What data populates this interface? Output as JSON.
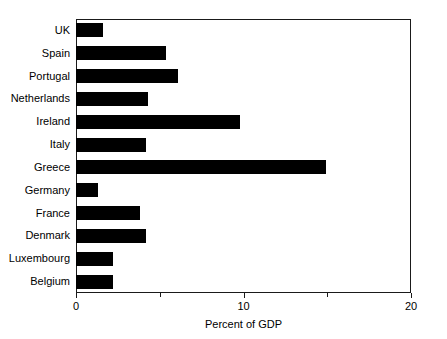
{
  "chart_data": {
    "type": "bar",
    "orientation": "horizontal",
    "title": "",
    "xlabel": "Percent of GDP",
    "ylabel": "",
    "xlim": [
      0,
      20
    ],
    "xticks": [
      0,
      10,
      20
    ],
    "xtick_labels": [
      "0",
      "10",
      "20"
    ],
    "xminor_ticks": [
      5,
      15
    ],
    "grid": false,
    "legend": null,
    "bar_color": "#000000",
    "categories": [
      "UK",
      "Spain",
      "Portugal",
      "Netherlands",
      "Ireland",
      "Italy",
      "Greece",
      "Germany",
      "France",
      "Denmark",
      "Luxembourg",
      "Belgium"
    ],
    "values": [
      1.6,
      5.4,
      6.1,
      4.3,
      9.8,
      4.2,
      14.9,
      1.3,
      3.8,
      4.2,
      2.2,
      2.2
    ]
  }
}
